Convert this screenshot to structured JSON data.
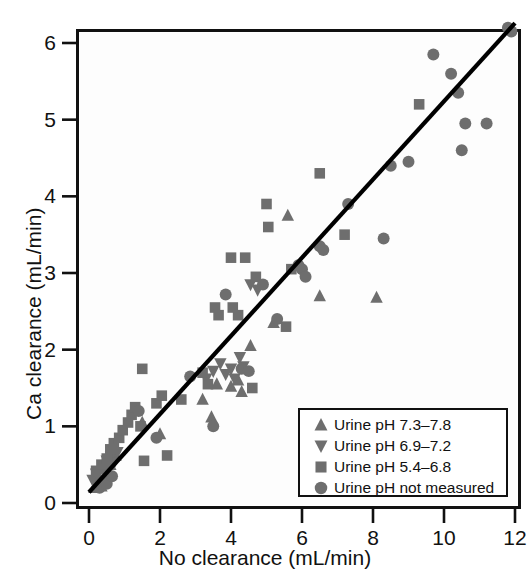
{
  "chart_data": {
    "type": "scatter",
    "title": "",
    "xlabel": "No clearance (mL/min)",
    "ylabel": "Ca clearance (mL/min)",
    "xlim": [
      -0.35,
      12.2
    ],
    "ylim": [
      -0.1,
      6.2
    ],
    "xticks": [
      0,
      2,
      4,
      6,
      8,
      10,
      12
    ],
    "yticks": [
      0,
      1,
      2,
      3,
      4,
      5,
      6
    ],
    "xticklabels": [
      "0",
      "2",
      "4",
      "6",
      "8",
      "10",
      "12"
    ],
    "yticklabels": [
      "0",
      "1",
      "2",
      "3",
      "4",
      "5",
      "6"
    ],
    "grid": false,
    "legend_position": "lower right",
    "marker_color": "#6e6e6e",
    "line_color": "#000000",
    "fit_line": {
      "label": "line of identity / regression",
      "x": [
        0.0,
        12.0
      ],
      "y": [
        0.14,
        6.26
      ]
    },
    "series": [
      {
        "name": "Urine pH 7.3-7.8",
        "marker": "triangle-up",
        "color": "#6e6e6e",
        "points": [
          [
            0.15,
            0.2
          ],
          [
            0.25,
            0.28
          ],
          [
            0.35,
            0.22
          ],
          [
            0.45,
            0.33
          ],
          [
            0.5,
            0.45
          ],
          [
            0.6,
            0.5
          ],
          [
            0.75,
            0.62
          ],
          [
            1.5,
            1.05
          ],
          [
            2.0,
            0.9
          ],
          [
            3.2,
            1.35
          ],
          [
            3.45,
            1.12
          ],
          [
            3.6,
            1.55
          ],
          [
            4.0,
            1.52
          ],
          [
            4.2,
            1.6
          ],
          [
            4.3,
            1.45
          ],
          [
            4.55,
            2.05
          ],
          [
            5.2,
            2.35
          ],
          [
            5.6,
            3.75
          ],
          [
            6.5,
            2.7
          ],
          [
            8.1,
            2.68
          ]
        ]
      },
      {
        "name": "Urine pH 6.9-7.2",
        "marker": "triangle-down",
        "color": "#6e6e6e",
        "points": [
          [
            0.1,
            0.3
          ],
          [
            0.2,
            0.38
          ],
          [
            0.3,
            0.3
          ],
          [
            0.4,
            0.42
          ],
          [
            0.5,
            0.55
          ],
          [
            0.55,
            0.48
          ],
          [
            0.62,
            0.6
          ],
          [
            0.7,
            0.52
          ],
          [
            0.8,
            0.66
          ],
          [
            3.3,
            1.62
          ],
          [
            3.5,
            1.72
          ],
          [
            3.7,
            1.82
          ],
          [
            3.85,
            1.68
          ],
          [
            4.0,
            1.75
          ],
          [
            4.1,
            1.62
          ],
          [
            4.25,
            1.9
          ],
          [
            4.35,
            1.78
          ],
          [
            4.55,
            2.85
          ],
          [
            4.75,
            2.78
          ]
        ]
      },
      {
        "name": "Urine pH 5.4-6.8",
        "marker": "square",
        "color": "#6e6e6e",
        "points": [
          [
            0.2,
            0.42
          ],
          [
            0.35,
            0.5
          ],
          [
            0.5,
            0.58
          ],
          [
            0.6,
            0.7
          ],
          [
            0.7,
            0.78
          ],
          [
            0.85,
            0.85
          ],
          [
            0.95,
            0.95
          ],
          [
            1.1,
            1.05
          ],
          [
            1.2,
            1.15
          ],
          [
            1.3,
            1.25
          ],
          [
            1.45,
            1.0
          ],
          [
            1.5,
            1.75
          ],
          [
            1.55,
            0.55
          ],
          [
            1.9,
            1.3
          ],
          [
            2.05,
            1.4
          ],
          [
            2.2,
            0.62
          ],
          [
            2.6,
            1.35
          ],
          [
            3.2,
            1.7
          ],
          [
            3.35,
            1.55
          ],
          [
            3.55,
            2.55
          ],
          [
            3.65,
            2.45
          ],
          [
            4.0,
            3.2
          ],
          [
            4.4,
            3.2
          ],
          [
            4.7,
            2.95
          ],
          [
            4.05,
            2.55
          ],
          [
            4.2,
            2.45
          ],
          [
            4.6,
            1.5
          ],
          [
            5.0,
            3.9
          ],
          [
            5.05,
            3.6
          ],
          [
            5.55,
            2.3
          ],
          [
            5.7,
            3.05
          ],
          [
            6.5,
            4.3
          ],
          [
            7.2,
            3.5
          ],
          [
            9.3,
            5.2
          ]
        ]
      },
      {
        "name": "Urine pH not measured",
        "marker": "circle",
        "color": "#6e6e6e",
        "points": [
          [
            0.3,
            0.2
          ],
          [
            0.5,
            0.25
          ],
          [
            0.65,
            0.35
          ],
          [
            1.4,
            1.2
          ],
          [
            1.9,
            0.85
          ],
          [
            2.85,
            1.65
          ],
          [
            3.5,
            1.0
          ],
          [
            3.85,
            2.72
          ],
          [
            4.3,
            1.75
          ],
          [
            4.5,
            1.72
          ],
          [
            4.9,
            2.85
          ],
          [
            5.3,
            2.4
          ],
          [
            5.9,
            3.1
          ],
          [
            6.0,
            3.05
          ],
          [
            6.1,
            2.95
          ],
          [
            6.5,
            3.35
          ],
          [
            6.6,
            3.3
          ],
          [
            7.3,
            3.9
          ],
          [
            8.3,
            3.45
          ],
          [
            8.5,
            4.4
          ],
          [
            9.0,
            4.45
          ],
          [
            9.7,
            5.85
          ],
          [
            10.2,
            5.6
          ],
          [
            10.4,
            5.35
          ],
          [
            10.5,
            4.6
          ],
          [
            10.6,
            4.95
          ],
          [
            11.2,
            4.95
          ],
          [
            11.8,
            6.2
          ],
          [
            11.9,
            6.15
          ]
        ]
      }
    ]
  },
  "axes": {
    "x_title": "No clearance (mL/min)",
    "y_title": "Ca clearance (mL/min)",
    "x_labels": [
      "0",
      "2",
      "4",
      "6",
      "8",
      "10",
      "12"
    ],
    "y_labels": [
      "6",
      "5",
      "4",
      "3",
      "2",
      "1",
      "0"
    ]
  },
  "legend": {
    "items": [
      {
        "symbol": "triangle-up-icon",
        "label": "Urine pH 7.3–7.8"
      },
      {
        "symbol": "triangle-down-icon",
        "label": "Urine pH 6.9–7.2"
      },
      {
        "symbol": "square-icon",
        "label": "Urine pH 5.4–6.8"
      },
      {
        "symbol": "circle-icon",
        "label": "Urine pH not measured"
      }
    ]
  }
}
